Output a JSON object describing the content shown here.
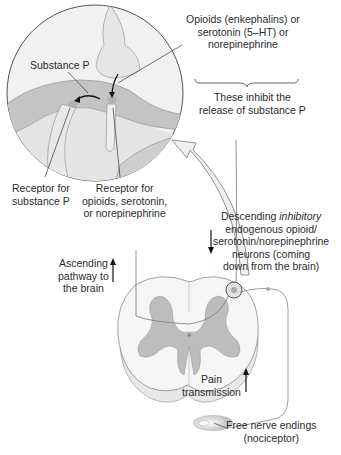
{
  "labels": {
    "substance_p": "Substance P",
    "opioids": [
      "Opioids (enkephalins) or",
      "serotonin (5–HT) or",
      "norepinephrine"
    ],
    "inhibit": [
      "These inhibit the",
      "release of substance P"
    ],
    "receptor_substance_p": [
      "Receptor for",
      "substance P"
    ],
    "receptor_opioids": [
      "Receptor for",
      "opioids, serotonin,",
      "or norepinephrine"
    ],
    "descending": {
      "prefix": "Descending ",
      "italic": "inhibitory",
      "lines": [
        "endogenous opioid/",
        "serotonin/norepinephrine",
        "neurons (coming",
        "down from the brain)"
      ]
    },
    "ascending": [
      "Ascending",
      "pathway to",
      "the brain"
    ],
    "pain": [
      "Pain",
      "transmission"
    ],
    "nerve_endings": [
      "Free nerve endings",
      "(nociceptor)"
    ]
  },
  "colors": {
    "tissue_light": "#ececec",
    "tissue_mid": "#c8c8c8",
    "gray_matter": "#bdbdbd",
    "outline": "#6a6a6a",
    "text": "#2b2b2b"
  }
}
